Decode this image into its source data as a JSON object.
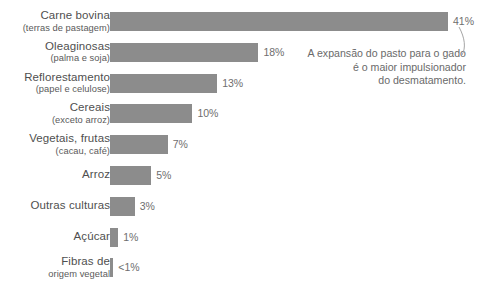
{
  "chart_data": {
    "type": "bar",
    "orientation": "horizontal",
    "title": "",
    "xlabel": "",
    "ylabel": "",
    "xlim": [
      0,
      41
    ],
    "grid": false,
    "legend": null,
    "bar_color": "#8c8c8c",
    "background_color": "#ffffff",
    "categories": [
      "Carne bovina (terras de pastagem)",
      "Oleaginosas (palma e soja)",
      "Reflorestamento (papel e celulose)",
      "Cereais (exceto arroz)",
      "Vegetais, frutas (cacau, café)",
      "Arroz",
      "Outras culturas",
      "Açúcar",
      "Fibras de origem vegetal"
    ],
    "values": [
      41,
      18,
      13,
      10,
      7,
      5,
      3,
      1,
      0.4
    ],
    "value_labels": [
      "41%",
      "18%",
      "13%",
      "10%",
      "7%",
      "5%",
      "3%",
      "1%",
      "<1%"
    ]
  },
  "rows": [
    {
      "label_main": "Carne bovina",
      "label_sub": "(terras de pastagem)",
      "value_label": "41%",
      "value": 41
    },
    {
      "label_main": "Oleaginosas",
      "label_sub": "(palma e soja)",
      "value_label": "18%",
      "value": 18
    },
    {
      "label_main": "Reflorestamento",
      "label_sub": "(papel e celulose)",
      "value_label": "13%",
      "value": 13
    },
    {
      "label_main": "Cereais",
      "label_sub": "(exceto arroz)",
      "value_label": "10%",
      "value": 10
    },
    {
      "label_main": "Vegetais, frutas",
      "label_sub": "(cacau, café)",
      "value_label": "7%",
      "value": 7
    },
    {
      "label_main": "Arroz",
      "label_sub": "",
      "value_label": "5%",
      "value": 5
    },
    {
      "label_main": "Outras culturas",
      "label_sub": "",
      "value_label": "3%",
      "value": 3
    },
    {
      "label_main": "Açúcar",
      "label_sub": "",
      "value_label": "1%",
      "value": 1
    },
    {
      "label_main": "Fibras de",
      "label_sub": "origem vegetal",
      "value_label": "<1%",
      "value": 0.4
    }
  ],
  "annotation": {
    "line1": "A expansão do pasto para o gado",
    "line2": "é o maior impulsionador",
    "line3": "do desmatamento."
  }
}
